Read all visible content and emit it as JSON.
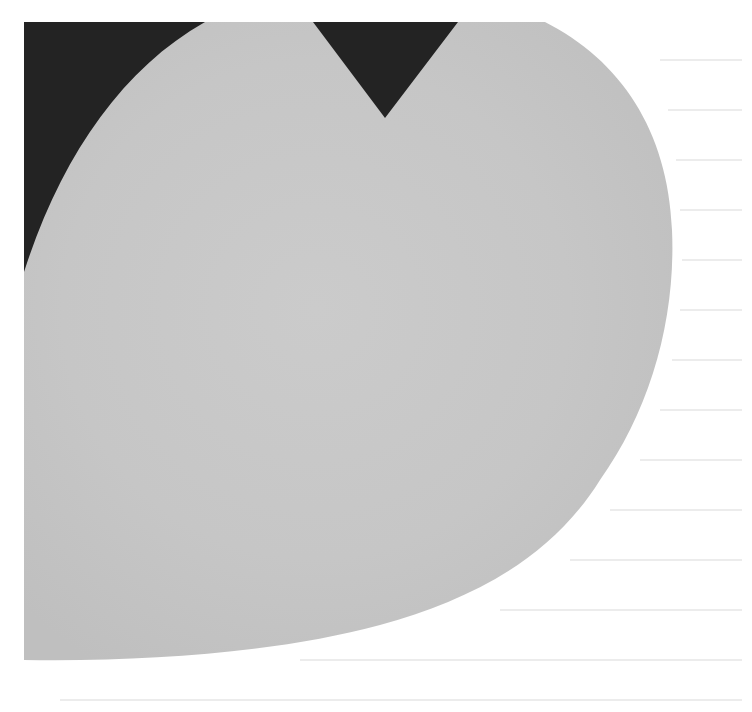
{
  "artwork": {
    "background_color": "#ffffff",
    "dark_color": "#232323",
    "shape_color": "#c6c6c6",
    "shape_highlight": "#d2d2d2",
    "bleed_line_color": "#ececec"
  }
}
